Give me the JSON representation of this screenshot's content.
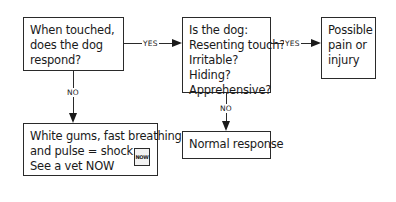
{
  "flowchart": {
    "nodes": {
      "start": {
        "lines": [
          "When touched,",
          "does the dog",
          "respond?"
        ]
      },
      "check": {
        "lines": [
          "Is the dog:",
          "Resenting touch?",
          "Irritable?",
          "Hiding?",
          "Apprehensive?"
        ]
      },
      "pain": {
        "lines": [
          "Possible",
          "pain or",
          "injury"
        ]
      },
      "shock": {
        "lines": [
          "White gums, fast breathing",
          "and pulse = shock.",
          "See a vet NOW"
        ],
        "badge": "NOW"
      },
      "normal": {
        "lines": [
          "Normal response"
        ]
      }
    },
    "edges": {
      "start_to_check": "YES",
      "check_to_pain": "YES",
      "start_to_shock": "NO",
      "check_to_normal": "NO"
    }
  }
}
